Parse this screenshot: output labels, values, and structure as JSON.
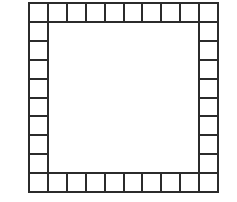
{
  "diagram": {
    "type": "square-border-grid",
    "cells_per_side": 10,
    "cell_size_px": 19.1,
    "line_color": "#2b2b2b",
    "fill_color": "#ffffff",
    "background_color": "#ffffff",
    "total_border_cells": 36,
    "interior": "empty"
  }
}
